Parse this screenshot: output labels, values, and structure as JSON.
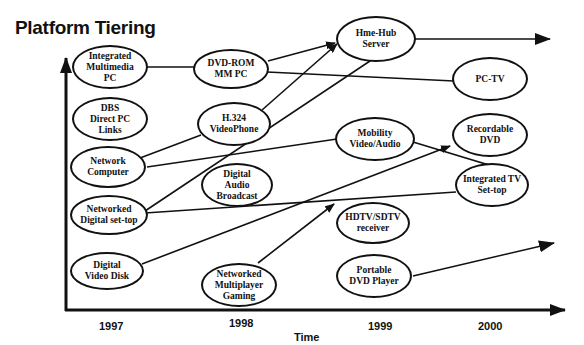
{
  "title": "Platform Tiering",
  "axes": {
    "x_label": "Time",
    "years": [
      "1997",
      "1998",
      "1999",
      "2000"
    ]
  },
  "nodes": [
    {
      "id": "integrated-multimedia-pc",
      "label": "Integrated\nMultimedia\nPC",
      "year": "1997"
    },
    {
      "id": "dbs-direct-pc-links",
      "label": "DBS\nDirect PC\nLinks",
      "year": "1997"
    },
    {
      "id": "network-computer",
      "label": "Network\nComputer",
      "year": "1997"
    },
    {
      "id": "networked-digital-set-top",
      "label": "Networked\nDigital set-top",
      "year": "1997"
    },
    {
      "id": "digital-video-disk",
      "label": "Digital\nVideo Disk",
      "year": "1997"
    },
    {
      "id": "dvd-rom-mm-pc",
      "label": "DVD-ROM\nMM PC",
      "year": "1998"
    },
    {
      "id": "h324-videophone",
      "label": "H.324\nVideoPhone",
      "year": "1998"
    },
    {
      "id": "digital-audio-broadcast",
      "label": "Digital\nAudio\nBroadcast",
      "year": "1998"
    },
    {
      "id": "networked-multiplayer-gaming",
      "label": "Networked\nMultiplayer\nGaming",
      "year": "1998"
    },
    {
      "id": "hme-hub-server",
      "label": "Hme-Hub\nServer",
      "year": "1999"
    },
    {
      "id": "mobility-video-audio",
      "label": "Mobility\nVideo/Audio",
      "year": "1999"
    },
    {
      "id": "hdtv-sdtv-receiver",
      "label": "HDTV/SDTV\nreceiver",
      "year": "1999"
    },
    {
      "id": "portable-dvd-player",
      "label": "Portable\nDVD Player",
      "year": "1999"
    },
    {
      "id": "pc-tv",
      "label": "PC-TV",
      "year": "2000"
    },
    {
      "id": "recordable-dvd",
      "label": "Recordable\nDVD",
      "year": "2000"
    },
    {
      "id": "integrated-tv-set-top",
      "label": "Integrated TV\nSet-top",
      "year": "2000"
    }
  ],
  "edges": [
    {
      "from": "integrated-multimedia-pc",
      "to": "dvd-rom-mm-pc",
      "arrow": false
    },
    {
      "from": "dvd-rom-mm-pc",
      "to": "hme-hub-server",
      "arrow": true
    },
    {
      "from": "dvd-rom-mm-pc",
      "to": "pc-tv",
      "arrow": false
    },
    {
      "from": "network-computer",
      "to": "h324-videophone",
      "arrow": false
    },
    {
      "from": "h324-videophone",
      "to": "hme-hub-server",
      "arrow": true
    },
    {
      "from": "network-computer",
      "to": "mobility-video-audio",
      "arrow": false
    },
    {
      "from": "mobility-video-audio",
      "to": "beyond-2000",
      "arrow": true
    },
    {
      "from": "networked-digital-set-top",
      "to": "hme-hub-server",
      "arrow": false
    },
    {
      "from": "networked-digital-set-top",
      "to": "integrated-tv-set-top",
      "arrow": false
    },
    {
      "from": "digital-video-disk",
      "to": "recordable-dvd",
      "arrow": true
    },
    {
      "from": "networked-multiplayer-gaming",
      "to": "integrated-tv-set-top-line",
      "arrow": true
    },
    {
      "from": "hme-hub-server",
      "to": "beyond-2000",
      "arrow": true
    },
    {
      "from": "portable-dvd-player",
      "to": "beyond-2000",
      "arrow": true
    }
  ]
}
